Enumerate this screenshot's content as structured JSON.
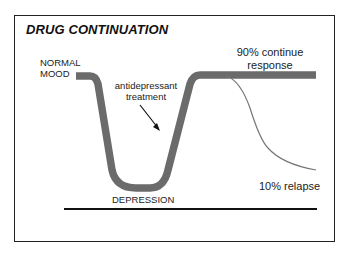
{
  "diagram": {
    "title": "DRUG CONTINUATION",
    "labels": {
      "normal_mood_line1": "NORMAL",
      "normal_mood_line2": "MOOD",
      "treatment_line1": "antidepressant",
      "treatment_line2": "treatment",
      "depression": "DEPRESSION",
      "continue_line1": "90% continue",
      "continue_line2": "response",
      "relapse": "10% relapse"
    },
    "colors": {
      "mood_curve": "#6b6b6b",
      "relapse_curve": "#777777",
      "baseline": "#111111",
      "frame": "#222222"
    }
  }
}
